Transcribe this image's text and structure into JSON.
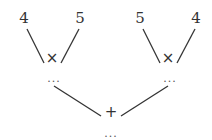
{
  "diagram": {
    "type": "expression-tree",
    "left_subtree": {
      "operator": "×",
      "left_leaf": "4",
      "right_leaf": "5",
      "result": "..."
    },
    "right_subtree": {
      "operator": "×",
      "left_leaf": "5",
      "right_leaf": "4",
      "result": "..."
    },
    "root": {
      "operator": "+",
      "result": "..."
    }
  }
}
